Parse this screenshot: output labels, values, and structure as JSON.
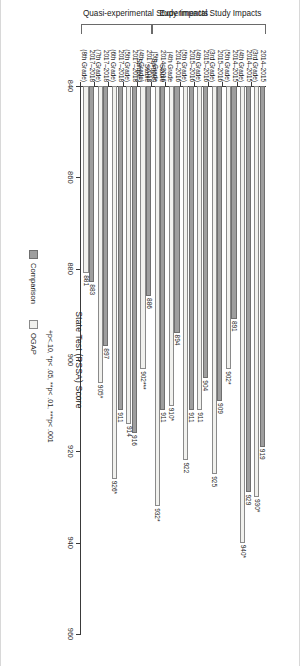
{
  "figure": {
    "groups": [
      {
        "label": "Experimental Study Impacts"
      },
      {
        "label": "Quasi-experimental Study Impacts"
      }
    ],
    "legend": {
      "position": "bottom",
      "items": [
        {
          "label": "Comparison",
          "color": "#9e9e9e"
        },
        {
          "label": "OGAP",
          "color": "#f1f1ee"
        }
      ]
    },
    "footnote": "+p<.10, *p< .05, **p< .01, ***p< .001"
  },
  "chart_data": {
    "type": "bar",
    "title": "",
    "xlabel": "",
    "ylabel": "State Test (PSSA) Score",
    "ylim": [
      840,
      960
    ],
    "yticks": [
      840,
      860,
      880,
      900,
      920,
      940,
      960
    ],
    "grid": false,
    "orientation": "vertical",
    "categories": [
      "2014–2015\n(3rd Grade)",
      "2014–2015\n(4th Grade)",
      "2014–2015\n(5th Grade)",
      "2015–2016\n(3rd Grade)",
      "2015–2016\n(4th Grade)",
      "2015–2016\n(5th Grade)",
      "2014–2016\n(4th Grade\nStable\nSample)",
      "2014–2016\n(5th Grade\nStable\nSample)",
      "2017–2018\n(4th Grade)",
      "2017–2018\n(5th Grade)",
      "2017–2018\n(6th Grade)",
      "2017–2018\n(7th Grade)",
      "2017–2018\n(8th Grade)"
    ],
    "group_spans": [
      {
        "name": "Experimental Study Impacts",
        "start": 0,
        "end": 7
      },
      {
        "name": "Quasi-experimental Study Impacts",
        "start": 8,
        "end": 12
      }
    ],
    "series": [
      {
        "name": "Comparison",
        "color": "#9e9e9e",
        "values": [
          919,
          929,
          891,
          909,
          904,
          911,
          894,
          911,
          886,
          916,
          911,
          897,
          883
        ],
        "labels": [
          "919",
          "929",
          "891",
          "909",
          "904",
          "911",
          "894",
          "911",
          "886",
          "916",
          "911",
          "897",
          "883"
        ]
      },
      {
        "name": "OGAP",
        "color": "#f1f1ee",
        "values": [
          930,
          940,
          902,
          925,
          911,
          922,
          910,
          932,
          902,
          914,
          926,
          905,
          881
        ],
        "labels": [
          "930*",
          "940*",
          "902*",
          "925",
          "911",
          "922",
          "910*",
          "932*",
          "902***",
          "914",
          "926*",
          "905*",
          "881"
        ]
      }
    ]
  }
}
